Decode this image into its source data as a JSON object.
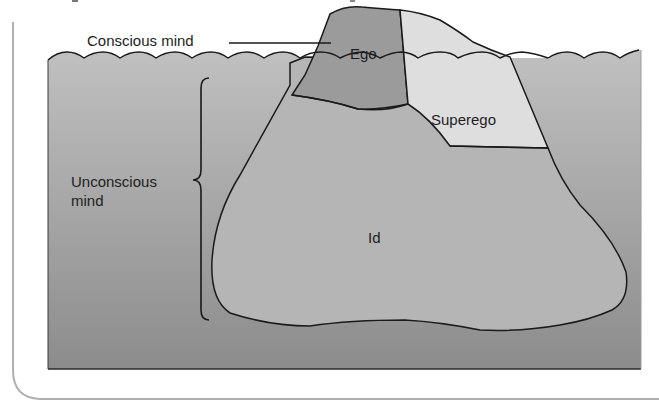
{
  "diagram": {
    "type": "iceberg-model",
    "labels": {
      "conscious": "Conscious mind",
      "unconscious_line1": "Unconscious",
      "unconscious_line2": "mind",
      "ego": "Ego",
      "superego": "Superego",
      "id": "Id"
    },
    "colors": {
      "background": "#ffffff",
      "water_top": "#bdbdbd",
      "water_bottom": "#8e8e8e",
      "ego_fill": "#9a9a9a",
      "superego_fill": "#dedede",
      "id_fill": "#b4b4b4",
      "outline": "#1a1a1a",
      "card_border": "#b0b0b0"
    }
  }
}
